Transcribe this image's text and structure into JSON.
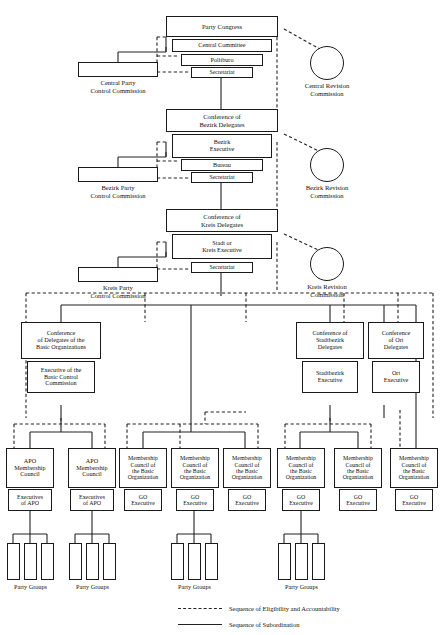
{
  "diagram": {
    "colors": {
      "line": "#222222",
      "box_border": "#1a1a1a",
      "background": "#ffffff",
      "text": "#111111"
    }
  },
  "nodes": {
    "party_congress": "Party Congress",
    "central_committee": "Central Committee",
    "politburo": "Politburo",
    "central_secretariat": "Secretariat",
    "central_party_control_commission": "Central Party\nControl Commission",
    "central_revision_commission": "Central Revision\nCommission",
    "conference_bezirk_delegates": "Conference of\nBezirk Delegates",
    "bezirk_executive": "Bezirk\nExecutive",
    "bureau": "Bureau",
    "bezirk_secretariat": "Secretariat",
    "bezirk_party_control_commission": "Bezirk Party\nControl Commission",
    "bezirk_revision_commission": "Bezirk Revision\nCommission",
    "conference_kreis_delegates": "Conference of\nKreis Delegates",
    "stadt_or_kreis_executive": "Stadt or\nKreis Executive",
    "kreis_secretariat": "Secretariat",
    "kreis_party_control_commission": "Kreis Party\nControl Commission",
    "kreis_revision_commission": "Kreis Revision\nCommission",
    "conference_delegates_basic_orgs": "Conference\nof Delegates of the\nBasic Organizations",
    "executive_basic_control_commission": "Executive of the\nBasic Control\nCommission",
    "conference_stadtbezirk_delegates": "Conference of\nStadtbezirk\nDelegates",
    "stadtbezirk_executive": "Stadtbezirk\nExecutive",
    "conference_ort_delegates": "Conference\nof Ort\nDelegates",
    "ort_executive": "Ort\nExecutive",
    "apo_membership_council": "APO\nMembership\nCouncil",
    "executives_of_apo": "Executives\nof APO",
    "membership_council_basic_org": "Membership\nCouncil of\nthe Basic\nOrganization",
    "go_executive": "GO\nExecutive",
    "party_groups": "Party Groups"
  },
  "counts": {
    "apo_columns": 2,
    "basic_org_columns": 6,
    "party_group_clusters": 4,
    "bars_per_cluster": 3
  },
  "legend": [
    {
      "style": "dashed",
      "label": "Sequence of Eligibility and Accountability"
    },
    {
      "style": "solid",
      "label": "Sequence of Subordination"
    }
  ]
}
